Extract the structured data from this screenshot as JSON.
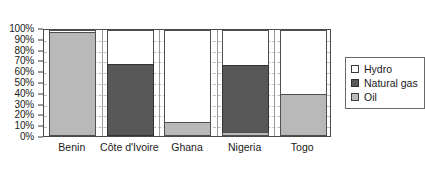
{
  "chart_data": {
    "type": "bar",
    "subtype": "stacked-100-percent",
    "title": "",
    "subtitle": "",
    "xlabel": "",
    "ylabel": "",
    "categories": [
      "Benin",
      "Côte d'Ivoire",
      "Ghana",
      "Nigeria",
      "Togo"
    ],
    "series": [
      {
        "name": "Oil",
        "color": "#b9b9b9",
        "values": [
          98,
          0,
          13,
          4,
          40
        ]
      },
      {
        "name": "Natural gas",
        "color": "#585858",
        "values": [
          0,
          68,
          0,
          63,
          0
        ]
      },
      {
        "name": "Hydro",
        "color": "#ffffff",
        "values": [
          2,
          32,
          87,
          33,
          60
        ]
      }
    ],
    "ylim": [
      0,
      100
    ],
    "y_ticks": [
      "0%",
      "10%",
      "20%",
      "30%",
      "40%",
      "50%",
      "60%",
      "70%",
      "80%",
      "90%",
      "100%"
    ],
    "y_tick_values": [
      0,
      10,
      20,
      30,
      40,
      50,
      60,
      70,
      80,
      90,
      100
    ],
    "grid": true,
    "grid_axis": "y",
    "legend": true,
    "legend_position": "right",
    "legend_entries": [
      {
        "label": "Hydro",
        "swatch": "white"
      },
      {
        "label": "Natural gas",
        "swatch": "dark-gray"
      },
      {
        "label": "Oil",
        "swatch": "light-gray"
      }
    ]
  },
  "colors": {
    "oil": "#b9b9b9",
    "natural_gas": "#585858",
    "hydro": "#ffffff",
    "axis": "#4a4a4a",
    "gridline": "#bdbdbd",
    "background": "#ffffff"
  }
}
